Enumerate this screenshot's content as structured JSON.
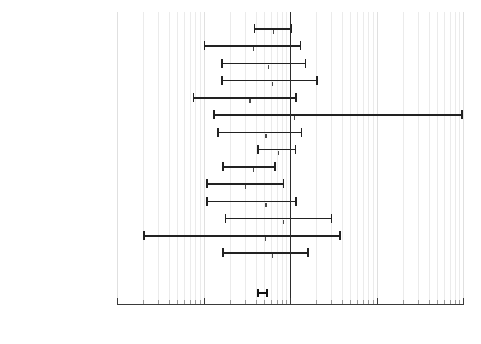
{
  "chart_data": {
    "type": "forest",
    "title": "",
    "xlabel": "",
    "ylabel": "",
    "xscale": "log",
    "xlim": [
      0.01,
      100
    ],
    "xticks": [
      0.01,
      0.1,
      1,
      10,
      100
    ],
    "xticklabels": [
      "0.01",
      "0.1",
      "1",
      "10",
      "100"
    ],
    "reference_line": 1,
    "grid": true,
    "legend": "none",
    "label_headers": [
      "study",
      "year"
    ],
    "rows": [
      {
        "study": "Liggins",
        "year": "1972",
        "odds_ratio": 0.63,
        "ci_low": 0.38,
        "ci_high": 1.05
      },
      {
        "study": "Block",
        "year": "1977",
        "odds_ratio": 0.37,
        "ci_low": 0.1,
        "ci_high": 1.35
      },
      {
        "study": "Schutte",
        "year": "1979",
        "odds_ratio": 0.55,
        "ci_low": 0.16,
        "ci_high": 1.55
      },
      {
        "study": "Taeusch",
        "year": "1979",
        "odds_ratio": 0.62,
        "ci_low": 0.16,
        "ci_high": 2.1
      },
      {
        "study": "Doran",
        "year": "1980",
        "odds_ratio": 0.34,
        "ci_low": 0.075,
        "ci_high": 1.2
      },
      {
        "study": "Teramo",
        "year": "1980",
        "odds_ratio": 1.1,
        "ci_low": 0.13,
        "ci_high": 100
      },
      {
        "study": "Gamsu",
        "year": "1989",
        "odds_ratio": 0.52,
        "ci_low": 0.145,
        "ci_high": 1.38
      },
      {
        "study": "US ante",
        "year": "1981",
        "odds_ratio": 0.72,
        "ci_low": 0.42,
        "ci_high": 1.18
      },
      {
        "study": "Morales",
        "year": "1986",
        "odds_ratio": 0.37,
        "ci_low": 0.165,
        "ci_high": 0.68
      },
      {
        "study": "Papageor",
        "year": "1979",
        "odds_ratio": 0.3,
        "ci_low": 0.108,
        "ci_high": 0.86
      },
      {
        "study": "Morrison",
        "year": "1978",
        "odds_ratio": 0.52,
        "ci_low": 0.108,
        "ci_high": 1.2
      },
      {
        "study": "Schmidt",
        "year": "1984",
        "odds_ratio": 0.82,
        "ci_low": 0.175,
        "ci_high": 3.1
      },
      {
        "study": "Carlan",
        "year": "1991",
        "odds_ratio": 0.51,
        "ci_low": 0.02,
        "ci_high": 3.85
      },
      {
        "study": "Garite",
        "year": "1992",
        "odds_ratio": 0.62,
        "ci_low": 0.165,
        "ci_high": 1.65
      }
    ],
    "summary": {
      "label": "Typical odds ratio",
      "odds_ratio": 0.48,
      "ci_low": 0.41,
      "ci_high": 0.56
    },
    "minor_ticks": [
      0.02,
      0.03,
      0.04,
      0.05,
      0.06,
      0.07,
      0.08,
      0.09,
      0.2,
      0.3,
      0.4,
      0.5,
      0.6,
      0.7,
      0.8,
      0.9,
      2,
      3,
      4,
      5,
      6,
      7,
      8,
      9,
      20,
      30,
      40,
      50,
      60,
      70,
      80,
      90
    ]
  }
}
